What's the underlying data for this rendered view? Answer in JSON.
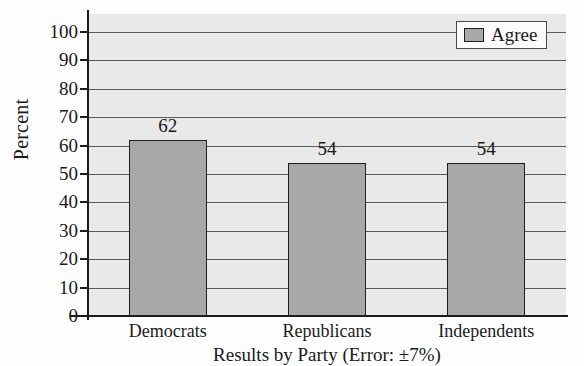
{
  "chart_data": {
    "type": "bar",
    "title": "",
    "subtitle": "",
    "categories": [
      "Democrats",
      "Republicans",
      "Independents"
    ],
    "values": [
      62,
      54,
      54
    ],
    "series": [
      {
        "name": "Agree",
        "values": [
          62,
          54,
          54
        ]
      }
    ],
    "xlabel": "Results by Party (Error: ±7%)",
    "ylabel": "Percent",
    "ylim": [
      0,
      100
    ],
    "ytick_step": 10,
    "yticks": [
      0,
      10,
      20,
      30,
      40,
      50,
      60,
      70,
      80,
      90,
      100
    ],
    "ytick_labels": [
      "0",
      "10",
      "20",
      "30",
      "40",
      "50",
      "60",
      "70",
      "80",
      "90",
      "100"
    ],
    "grid": true,
    "grid_axis": "y",
    "legend": {
      "position": "top-right",
      "entries": [
        {
          "label": "Agree",
          "color": "#a8a8a8"
        }
      ]
    },
    "data_labels": [
      "62",
      "54",
      "54"
    ],
    "colors": {
      "bar_fill": "#a8a8a8",
      "bar_edge": "#1e1e1e",
      "plot_background": "#e9e9e9",
      "gridline": "#5a5a5a",
      "axis": "#1c1c1c",
      "text": "#1a1a1a",
      "legend_background": "#fbfbfb",
      "legend_border": "#4a4a4a"
    }
  }
}
